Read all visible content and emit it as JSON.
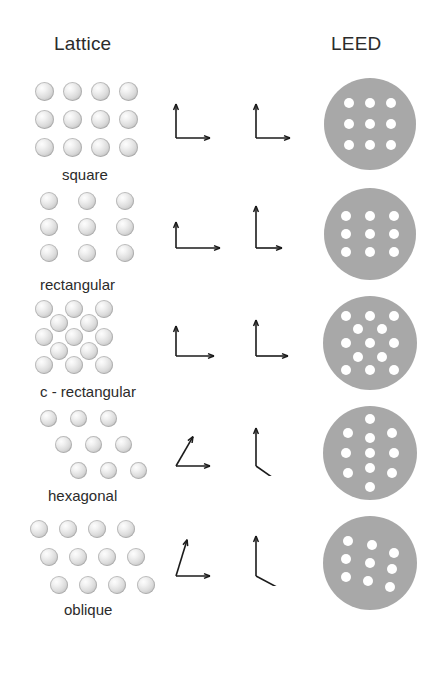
{
  "headers": {
    "lattice": "Lattice",
    "leed": "LEED"
  },
  "caption": "",
  "colors": {
    "background": "#ffffff",
    "atom_fill": "#dcdcdc",
    "atom_highlight": "#fdfdfd",
    "leed_disk": "#a8a8a8",
    "leed_spot": "#ffffff",
    "text": "#2b2b2b",
    "arrow": "#1b1b1b"
  },
  "rows": [
    {
      "id": "square",
      "label": "square",
      "lattice": {
        "type": "square",
        "columns": 4,
        "rows": 3,
        "atom_diameter": 19,
        "dx": 28,
        "dy": 28,
        "shear": 0,
        "centered": false
      },
      "real_vectors": {
        "a1": {
          "angle_deg": 90,
          "length": 34
        },
        "a2": {
          "angle_deg": 0,
          "length": 34
        }
      },
      "reciprocal_vectors": {
        "b1": {
          "angle_deg": 90,
          "length": 34
        },
        "b2": {
          "angle_deg": 0,
          "length": 34
        }
      },
      "leed": {
        "pattern": "square",
        "radius": 46,
        "spot_radius": 5,
        "spots": [
          [
            -21,
            -21
          ],
          [
            0,
            -21
          ],
          [
            21,
            -21
          ],
          [
            -21,
            0
          ],
          [
            0,
            0
          ],
          [
            21,
            0
          ],
          [
            -21,
            21
          ],
          [
            0,
            21
          ],
          [
            21,
            21
          ]
        ]
      }
    },
    {
      "id": "rectangular",
      "label": "rectangular",
      "lattice": {
        "type": "rectangular",
        "columns": 3,
        "rows": 3,
        "atom_diameter": 18,
        "dx": 38,
        "dy": 26,
        "shear": 0,
        "centered": false
      },
      "real_vectors": {
        "a1": {
          "angle_deg": 90,
          "length": 26
        },
        "a2": {
          "angle_deg": 0,
          "length": 44
        }
      },
      "reciprocal_vectors": {
        "b1": {
          "angle_deg": 90,
          "length": 42
        },
        "b2": {
          "angle_deg": 0,
          "length": 26
        }
      },
      "leed": {
        "pattern": "rectangular",
        "radius": 46,
        "spot_radius": 5,
        "spots": [
          [
            -24,
            -18
          ],
          [
            0,
            -18
          ],
          [
            24,
            -18
          ],
          [
            -24,
            0
          ],
          [
            0,
            0
          ],
          [
            24,
            0
          ],
          [
            -24,
            18
          ],
          [
            0,
            18
          ],
          [
            24,
            18
          ]
        ]
      }
    },
    {
      "id": "c-rectangular",
      "label": "c - rectangular",
      "lattice": {
        "type": "centered-rectangular",
        "columns": 3,
        "rows": 3,
        "atom_diameter": 18,
        "dx": 30,
        "dy": 28,
        "shear": 0,
        "centered": true
      },
      "real_vectors": {
        "a1": {
          "angle_deg": 90,
          "length": 30
        },
        "a2": {
          "angle_deg": 0,
          "length": 38
        }
      },
      "reciprocal_vectors": {
        "b1": {
          "angle_deg": 90,
          "length": 36
        },
        "b2": {
          "angle_deg": 0,
          "length": 32
        }
      },
      "leed": {
        "pattern": "centered-rectangular",
        "radius": 47,
        "spot_radius": 5,
        "spots": [
          [
            -24,
            -27
          ],
          [
            0,
            -27
          ],
          [
            24,
            -27
          ],
          [
            -12,
            -14
          ],
          [
            12,
            -14
          ],
          [
            -24,
            0
          ],
          [
            0,
            0
          ],
          [
            24,
            0
          ],
          [
            -12,
            14
          ],
          [
            12,
            14
          ],
          [
            -24,
            27
          ],
          [
            0,
            27
          ],
          [
            24,
            27
          ]
        ]
      }
    },
    {
      "id": "hexagonal",
      "label": "hexagonal",
      "lattice": {
        "type": "hexagonal",
        "columns": 3,
        "rows": 3,
        "atom_diameter": 17,
        "dx": 30,
        "dy": 26,
        "shear": 15,
        "centered": false
      },
      "real_vectors": {
        "a1": {
          "angle_deg": 60,
          "length": 34
        },
        "a2": {
          "angle_deg": 0,
          "length": 34
        }
      },
      "reciprocal_vectors": {
        "b1": {
          "angle_deg": 90,
          "length": 38
        },
        "b2": {
          "angle_deg": -35,
          "length": 38
        }
      },
      "leed": {
        "pattern": "hexagonal",
        "radius": 47,
        "spot_radius": 5,
        "spots": [
          [
            0,
            -34
          ],
          [
            -22,
            -20
          ],
          [
            22,
            -20
          ],
          [
            0,
            -15
          ],
          [
            -24,
            0
          ],
          [
            24,
            0
          ],
          [
            0,
            0
          ],
          [
            -22,
            20
          ],
          [
            22,
            20
          ],
          [
            0,
            15
          ],
          [
            0,
            34
          ]
        ]
      }
    },
    {
      "id": "oblique",
      "label": "oblique",
      "lattice": {
        "type": "oblique",
        "columns": 4,
        "rows": 3,
        "atom_diameter": 18,
        "dx": 29,
        "dy": 28,
        "shear": 10,
        "centered": false
      },
      "real_vectors": {
        "a1": {
          "angle_deg": 73,
          "length": 38
        },
        "a2": {
          "angle_deg": 0,
          "length": 34
        }
      },
      "reciprocal_vectors": {
        "b1": {
          "angle_deg": 90,
          "length": 40
        },
        "b2": {
          "angle_deg": -28,
          "length": 40
        }
      },
      "leed": {
        "pattern": "oblique",
        "radius": 47,
        "spot_radius": 5,
        "spots": [
          [
            -22,
            -22
          ],
          [
            2,
            -18
          ],
          [
            24,
            -10
          ],
          [
            -24,
            -4
          ],
          [
            0,
            0
          ],
          [
            22,
            6
          ],
          [
            -24,
            14
          ],
          [
            -2,
            18
          ],
          [
            20,
            24
          ]
        ]
      }
    }
  ],
  "layout": {
    "row_tops": [
      82,
      192,
      300,
      410,
      520
    ],
    "label_tops": [
      166,
      276,
      383,
      487,
      601
    ],
    "leed_center_x": 370
  }
}
